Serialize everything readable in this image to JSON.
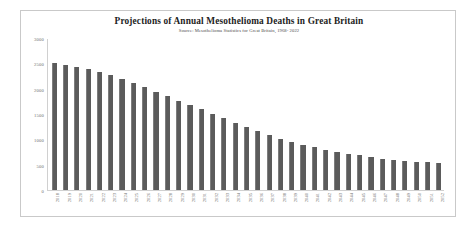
{
  "chart_data": {
    "type": "bar",
    "title": "Projections of Annual Mesothelioma Deaths in  Great Britain",
    "subtitle": "Source: Mesothelioma Statistics for Great Britain, 1968- 2022",
    "xlabel": "",
    "ylabel": "",
    "ylim": [
      0,
      3000
    ],
    "yticks": [
      0,
      500,
      1000,
      1500,
      2000,
      2500,
      3000
    ],
    "ytick_labels": [
      "0",
      "500",
      "1000",
      "1500",
      "2000",
      "2500",
      "3000"
    ],
    "grid": false,
    "legend": "none",
    "bar_color": "#5b5b5b",
    "categories": [
      "2018",
      "2019",
      "2020",
      "2021",
      "2022",
      "2023",
      "2024",
      "2025",
      "2026",
      "2027",
      "2028",
      "2029",
      "2030",
      "2031",
      "2032",
      "2033",
      "2034",
      "2035",
      "2036",
      "2037",
      "2038",
      "2039",
      "2040",
      "2041",
      "2042",
      "2043",
      "2044",
      "2045",
      "2046",
      "2047",
      "2048",
      "2049",
      "2050",
      "2051",
      "2052"
    ],
    "values": [
      2520,
      2490,
      2450,
      2410,
      2350,
      2280,
      2210,
      2120,
      2040,
      1955,
      1870,
      1775,
      1690,
      1605,
      1515,
      1425,
      1335,
      1250,
      1170,
      1090,
      1015,
      950,
      900,
      850,
      800,
      760,
      720,
      690,
      655,
      625,
      600,
      575,
      560,
      548,
      545
    ]
  },
  "figure": {
    "frame_color": "#c9c9c9",
    "background": "#ffffff"
  }
}
